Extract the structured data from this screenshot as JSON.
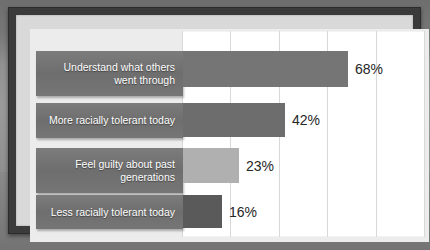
{
  "chart_data": {
    "type": "bar",
    "orientation": "horizontal",
    "title": "",
    "xlabel": "",
    "ylabel": "",
    "xlim": [
      0,
      100
    ],
    "grid": true,
    "gridline_values": [
      0,
      20,
      40,
      60,
      80,
      100
    ],
    "legend": "none",
    "categories": [
      "Understand what others\nwent through",
      "More racially tolerant today",
      "Feel guilty about past\ngenerations",
      "Less racially tolerant today"
    ],
    "values": [
      68,
      42,
      23,
      16
    ],
    "value_labels": [
      "68%",
      "42%",
      "23%",
      "16%"
    ],
    "bar_colors": [
      "#757575",
      "#6d6d6d",
      "#b0b0b0",
      "#5a5a5a"
    ]
  },
  "style": {
    "frame_color": "#3b3b3b",
    "panel_color": "#ececec",
    "plot_background": "#ffffff",
    "gridline_color": "#d8d8d8",
    "category_box_color": "#737373",
    "category_text_color": "#ffffff",
    "value_text_color": "#262626"
  },
  "rows": [
    {
      "label": "Understand what others\nwent through",
      "value": 68,
      "value_label": "68%",
      "bar_color": "#757575"
    },
    {
      "label": "More racially tolerant today",
      "value": 42,
      "value_label": "42%",
      "bar_color": "#6d6d6d"
    },
    {
      "label": "Feel guilty about past\ngenerations",
      "value": 23,
      "value_label": "23%",
      "bar_color": "#b0b0b0"
    },
    {
      "label": "Less racially tolerant today",
      "value": 16,
      "value_label": "16%",
      "bar_color": "#5a5a5a"
    }
  ]
}
